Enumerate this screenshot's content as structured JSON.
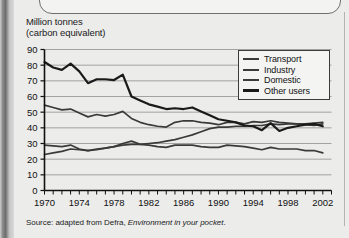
{
  "figure": {
    "axis_title_line1": "Million tonnes",
    "axis_title_line2": "(carbon equivalent)",
    "source_prefix": "Source: adapted from Defra,",
    "source_italic": "Environment in your pocket",
    "source_suffix": "."
  },
  "legend": {
    "items": [
      {
        "label": "Transport",
        "color": "#3a3a3a"
      },
      {
        "label": "Industry",
        "color": "#3a3a3a"
      },
      {
        "label": "Domestic",
        "color": "#3a3a3a"
      },
      {
        "label": "Other users",
        "color": "#1a1a1a"
      }
    ]
  },
  "chart_data": {
    "type": "line",
    "title": "",
    "subtitle": "",
    "xlabel": "",
    "ylabel": "Million tonnes (carbon equivalent)",
    "xlim": [
      1970,
      2003
    ],
    "ylim": [
      0,
      90
    ],
    "ytick_step": 10,
    "yticks": [
      0,
      10,
      20,
      30,
      40,
      50,
      60,
      70,
      80,
      90
    ],
    "xticks_labeled": [
      1970,
      1974,
      1978,
      1982,
      1986,
      1990,
      1994,
      1998,
      2002
    ],
    "xtick_interval_minor": 1,
    "grid": "horizontal",
    "legend_position": "top-right",
    "x": [
      1970,
      1971,
      1972,
      1973,
      1974,
      1975,
      1976,
      1977,
      1978,
      1979,
      1980,
      1981,
      1982,
      1983,
      1984,
      1985,
      1986,
      1987,
      1988,
      1989,
      1990,
      1991,
      1992,
      1993,
      1994,
      1995,
      1996,
      1997,
      1998,
      1999,
      2000,
      2001,
      2002
    ],
    "series": [
      {
        "name": "Transport",
        "values": [
          23.0,
          24.0,
          25.0,
          26.5,
          26.0,
          25.5,
          26.5,
          27.0,
          28.0,
          29.0,
          29.5,
          29.5,
          30.0,
          30.5,
          31.5,
          32.5,
          34.0,
          35.5,
          37.5,
          39.5,
          40.5,
          40.5,
          41.0,
          41.0,
          41.5,
          41.5,
          42.5,
          42.0,
          42.5,
          42.5,
          42.5,
          43.0,
          43.5
        ]
      },
      {
        "name": "Industry",
        "values": [
          54.5,
          53.0,
          51.5,
          52.0,
          49.5,
          47.0,
          48.5,
          47.5,
          48.5,
          50.5,
          46.0,
          43.5,
          42.0,
          41.0,
          40.5,
          43.5,
          44.5,
          44.5,
          43.5,
          43.0,
          42.0,
          43.5,
          43.5,
          42.5,
          44.0,
          43.5,
          44.5,
          43.5,
          43.0,
          42.5,
          42.0,
          41.5,
          42.5
        ]
      },
      {
        "name": "Domestic",
        "values": [
          29.0,
          28.5,
          28.0,
          29.0,
          26.5,
          25.5,
          26.0,
          27.0,
          28.0,
          30.0,
          31.5,
          29.5,
          29.0,
          28.0,
          27.5,
          29.0,
          29.0,
          29.0,
          28.0,
          27.5,
          27.5,
          29.0,
          28.5,
          28.0,
          27.0,
          26.0,
          27.5,
          26.5,
          26.5,
          26.5,
          25.5,
          25.5,
          24.0
        ]
      },
      {
        "name": "Other users",
        "values": [
          82.0,
          78.5,
          77.0,
          81.0,
          76.0,
          68.5,
          71.0,
          71.0,
          70.5,
          74.0,
          60.0,
          57.5,
          55.0,
          53.5,
          52.0,
          52.5,
          52.0,
          53.0,
          50.5,
          48.0,
          45.5,
          44.5,
          43.5,
          41.5,
          41.0,
          38.5,
          43.0,
          38.0,
          40.0,
          41.0,
          42.0,
          42.5,
          41.0
        ]
      }
    ]
  }
}
